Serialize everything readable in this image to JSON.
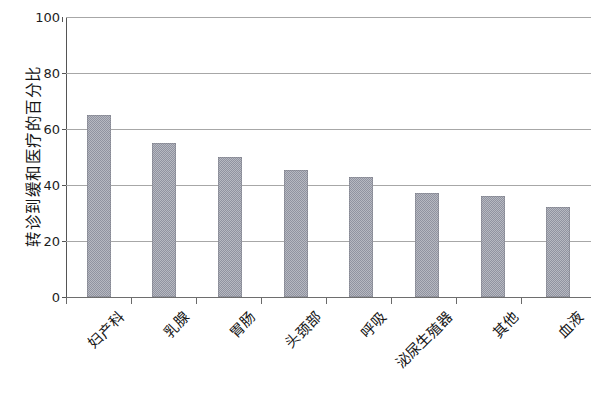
{
  "chart_data": {
    "type": "bar",
    "title": "",
    "xlabel": "",
    "ylabel": "转诊到缓和医疗的百分比",
    "categories": [
      "妇产科",
      "乳腺",
      "胃肠",
      "头颈部",
      "呼吸",
      "泌尿生殖器",
      "其他",
      "血液"
    ],
    "values": [
      65,
      55,
      50,
      45.5,
      43,
      37,
      36,
      32
    ],
    "ylim": [
      0,
      100
    ],
    "yticks": [
      0,
      20,
      40,
      60,
      80,
      100
    ],
    "ytick_labels": [
      "0",
      "20",
      "40",
      "60",
      "80",
      "100"
    ],
    "grid": true,
    "legend": null,
    "bar_color": "#9093a0",
    "gridline_color": "#a7a7a7",
    "axis_color": "#555555"
  }
}
